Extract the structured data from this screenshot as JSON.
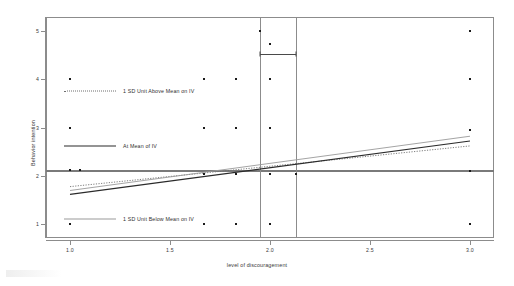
{
  "chart_data": {
    "type": "scatter",
    "title": "",
    "xlabel": "level of discouragement",
    "ylabel": "Behavior intention",
    "xlim": [
      0.88,
      3.12
    ],
    "ylim": [
      0.72,
      5.28
    ],
    "xticks": [
      "1.0",
      "1.5",
      "2.0",
      "2.5",
      "3.0"
    ],
    "xtick_values": [
      1.0,
      1.5,
      2.0,
      2.5,
      3.0
    ],
    "yticks": [
      "1",
      "2",
      "3",
      "4",
      "5"
    ],
    "ytick_values": [
      1,
      2,
      3,
      4,
      5
    ],
    "grid": false,
    "legend_position": "inside-left",
    "points": [
      {
        "x": 1.0,
        "y": 4
      },
      {
        "x": 1.0,
        "y": 3
      },
      {
        "x": 1.0,
        "y": 2.12
      },
      {
        "x": 1.05,
        "y": 2.12
      },
      {
        "x": 1.0,
        "y": 1
      },
      {
        "x": 1.67,
        "y": 4
      },
      {
        "x": 1.67,
        "y": 3
      },
      {
        "x": 1.67,
        "y": 2.05
      },
      {
        "x": 1.67,
        "y": 1
      },
      {
        "x": 1.83,
        "y": 4
      },
      {
        "x": 1.83,
        "y": 3
      },
      {
        "x": 1.83,
        "y": 2.05
      },
      {
        "x": 1.83,
        "y": 1
      },
      {
        "x": 1.95,
        "y": 5
      },
      {
        "x": 2.0,
        "y": 4.73
      },
      {
        "x": 2.0,
        "y": 4
      },
      {
        "x": 2.0,
        "y": 3
      },
      {
        "x": 2.0,
        "y": 2.05
      },
      {
        "x": 2.0,
        "y": 1
      },
      {
        "x": 2.13,
        "y": 2.05
      },
      {
        "x": 3.0,
        "y": 5
      },
      {
        "x": 3.0,
        "y": 4
      },
      {
        "x": 3.0,
        "y": 2.95
      },
      {
        "x": 3.0,
        "y": 2.1
      },
      {
        "x": 3.0,
        "y": 1
      }
    ],
    "series": [
      {
        "name": "1 SD Unit Above Mean on IV",
        "style": "dotted",
        "color": "#6e6e6e",
        "x": [
          1.0,
          3.0
        ],
        "y": [
          1.78,
          2.62
        ]
      },
      {
        "name": "At Mean of IV",
        "style": "solid",
        "color": "#2b2b2b",
        "x": [
          1.0,
          3.0
        ],
        "y": [
          1.62,
          2.72
        ]
      },
      {
        "name": "1 SD Unit Below Mean on IV",
        "style": "solid-light",
        "color": "#9a9a9a",
        "x": [
          1.0,
          3.0
        ],
        "y": [
          1.7,
          2.82
        ]
      }
    ],
    "reference_lines": [
      {
        "orientation": "horizontal",
        "value": 2.1,
        "color": "#7a7a7a"
      },
      {
        "orientation": "vertical",
        "value": 1.95,
        "color": "#8c8c8c"
      },
      {
        "orientation": "vertical",
        "value": 2.13,
        "color": "#8c8c8c"
      }
    ],
    "annotations": [
      {
        "type": "error-bar",
        "x_low": 1.95,
        "x_high": 2.13,
        "y": 4.52
      }
    ]
  },
  "legend": {
    "items": [
      {
        "label": "1 SD Unit Above Mean on IV"
      },
      {
        "label": "At Mean of IV"
      },
      {
        "label": "1 SD Unit Below Mean on IV"
      }
    ]
  }
}
